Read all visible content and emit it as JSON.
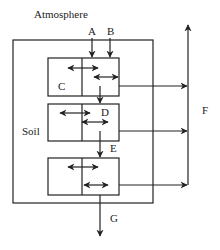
{
  "diagram": {
    "labels": {
      "atmosphere": "Atmosphere",
      "soil": "Soil",
      "A": "A",
      "B": "B",
      "C": "C",
      "D": "D",
      "E": "E",
      "F": "F",
      "G": "G"
    },
    "structure": {
      "outer_box": "Soil",
      "compartments": 3,
      "inputs_from_atmosphere": [
        "A",
        "B"
      ],
      "transfer_between_layers": [
        "D",
        "E"
      ],
      "lateral_output": "F",
      "bottom_output": "G"
    },
    "colors": {
      "line": "#222222",
      "background": "#ffffff"
    }
  }
}
